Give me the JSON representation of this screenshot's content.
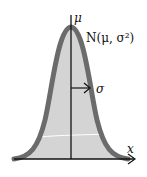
{
  "diagram": {
    "labels": {
      "mean": "μ",
      "distribution": "N(μ, σ²)",
      "std_dev": "σ",
      "x_axis": "x"
    },
    "colors": {
      "curve": "#6b6b6b",
      "fill": "#d4d4d4",
      "axis": "#111111",
      "background": "#ffffff"
    }
  }
}
